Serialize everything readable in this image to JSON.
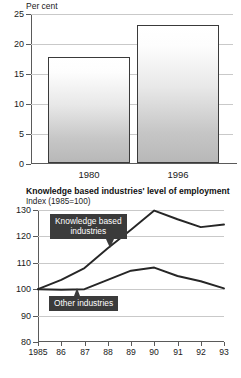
{
  "bar_chart": {
    "unit_label": "Per cent",
    "y_ticks": [
      "25",
      "20",
      "15",
      "10",
      "5",
      "0"
    ],
    "x_labels": [
      "1980",
      "1996"
    ]
  },
  "line_chart": {
    "title": "Knowledge based industries' level of employment",
    "subtitle": "Index (1985=100)",
    "y_ticks": [
      "130",
      "120",
      "110",
      "100",
      "90",
      "80"
    ],
    "x_labels": [
      "1985",
      "86",
      "87",
      "88",
      "89",
      "90",
      "91",
      "92",
      "93"
    ],
    "callout_knowledge_line1": "Knowledge based",
    "callout_knowledge_line2": "industries",
    "callout_other": "Other industries"
  },
  "chart_data": [
    {
      "type": "bar",
      "title": "",
      "xlabel": "",
      "ylabel": "Per cent",
      "categories": [
        "1980",
        "1996"
      ],
      "values": [
        17.7,
        23.0
      ],
      "ylim": [
        0,
        25
      ],
      "yticks": [
        0,
        5,
        10,
        15,
        20,
        25
      ],
      "grid": true,
      "legend": "none"
    },
    {
      "type": "line",
      "title": "Knowledge based industries' level of employment",
      "subtitle": "Index (1985=100)",
      "xlabel": "",
      "ylabel": "Index (1985=100)",
      "x": [
        1985,
        1986,
        1987,
        1988,
        1989,
        1990,
        1991,
        1992,
        1993
      ],
      "xtick_labels": [
        "1985",
        "86",
        "87",
        "88",
        "89",
        "90",
        "91",
        "92",
        "93"
      ],
      "ylim": [
        80,
        130
      ],
      "yticks": [
        80,
        90,
        100,
        110,
        120,
        130
      ],
      "grid": true,
      "legend": "annotations",
      "series": [
        {
          "name": "Knowledge based industries",
          "values": [
            100,
            103.5,
            108,
            115.5,
            122.5,
            129.8,
            126.5,
            123.5,
            124.5
          ]
        },
        {
          "name": "Other industries",
          "values": [
            100,
            99.8,
            100,
            103.5,
            107,
            108.2,
            105,
            103,
            100.3
          ]
        }
      ]
    }
  ]
}
